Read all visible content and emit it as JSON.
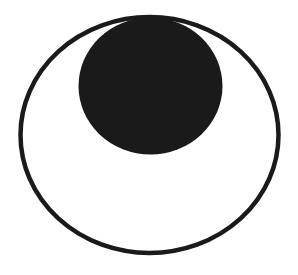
{
  "diagram": {
    "colors": {
      "background": "#ffffff",
      "stroke": "#1a1a1a",
      "fill": "#1a1a1a"
    },
    "outer_ellipse": {
      "cx": 149.5,
      "cy": 135,
      "rx": 129,
      "ry": 118,
      "stroke_width": 4.5,
      "filled": false
    },
    "inner_ellipse": {
      "cx": 150.5,
      "cy": 86,
      "rx": 72,
      "ry": 68.5,
      "filled": true
    }
  }
}
